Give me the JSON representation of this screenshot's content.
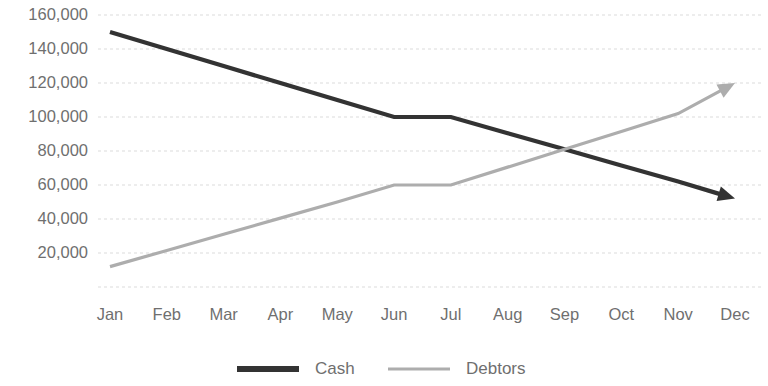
{
  "chart_data": {
    "type": "line",
    "title": "",
    "subtitle": "",
    "xlabel": "",
    "ylabel": "",
    "categories": [
      "Jan",
      "Feb",
      "Mar",
      "Apr",
      "May",
      "Jun",
      "Jul",
      "Aug",
      "Sep",
      "Oct",
      "Nov",
      "Dec"
    ],
    "series": [
      {
        "name": "Cash",
        "color": "#333333",
        "line_width": 4.2,
        "arrow_end": true,
        "values": [
          150000,
          140000,
          130000,
          120000,
          110000,
          100000,
          100000,
          90500,
          81000,
          71500,
          62000,
          52000
        ]
      },
      {
        "name": "Debtors",
        "color": "#adadad",
        "line_width": 3.2,
        "arrow_end": true,
        "values": [
          12000,
          21500,
          31000,
          40500,
          50000,
          60000,
          60000,
          70500,
          81000,
          91500,
          102000,
          120000
        ]
      }
    ],
    "ylim": [
      0,
      160000
    ],
    "xlim_categories": 12,
    "y_ticks": [
      20000,
      40000,
      60000,
      80000,
      100000,
      120000,
      140000,
      160000
    ],
    "y_tick_labels": [
      "20,000",
      "40,000",
      "60,000",
      "80,000",
      "100,000",
      "120,000",
      "140,000",
      "160,000"
    ],
    "baseline_gridline": 0,
    "grid": true,
    "grid_style": "dashed-horizontal",
    "grid_color": "#d6d6d6",
    "legend": {
      "position": "bottom-center",
      "entries": [
        {
          "label": "Cash",
          "color": "#333333",
          "swatch": "thick-line"
        },
        {
          "label": "Debtors",
          "color": "#adadad",
          "swatch": "thin-line"
        }
      ]
    },
    "background": "#ffffff",
    "axis_label_color": "#6f6f6f"
  }
}
